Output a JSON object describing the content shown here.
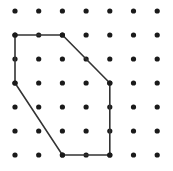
{
  "figure": {
    "background_color": "#ffffff",
    "width": 173,
    "height": 171
  },
  "grid": {
    "name": "geoboard-dot-grid",
    "columns": 7,
    "rows": 7,
    "origin_x": 15,
    "origin_y": 11,
    "spacing_x": 23.7,
    "spacing_y": 24.0,
    "dot_radius": 2.6,
    "dot_color": "#1a1a1a"
  },
  "shape": {
    "name": "hexagon",
    "type": "polygon",
    "stroke_color": "#333333",
    "stroke_width": 1.6,
    "fill": "none",
    "vertices_grid": [
      {
        "col": 0,
        "row": 1
      },
      {
        "col": 2,
        "row": 1
      },
      {
        "col": 4,
        "row": 3
      },
      {
        "col": 4,
        "row": 6
      },
      {
        "col": 2,
        "row": 6
      },
      {
        "col": 0,
        "row": 3
      }
    ]
  },
  "chart_data": {
    "type": "scatter",
    "xlabel": "",
    "ylabel": "",
    "xlim": [
      0,
      6
    ],
    "ylim": [
      0,
      6
    ],
    "grid": false,
    "legend": "none",
    "categories": [
      "0",
      "1",
      "2",
      "3",
      "4",
      "5",
      "6"
    ],
    "series": [
      {
        "name": "grid-dots",
        "x": [
          0,
          1,
          2,
          3,
          4,
          5,
          6,
          0,
          1,
          2,
          3,
          4,
          5,
          6,
          0,
          1,
          2,
          3,
          4,
          5,
          6,
          0,
          1,
          2,
          3,
          4,
          5,
          6,
          0,
          1,
          2,
          3,
          4,
          5,
          6,
          0,
          1,
          2,
          3,
          4,
          5,
          6,
          0,
          1,
          2,
          3,
          4,
          5,
          6
        ],
        "y": [
          0,
          0,
          0,
          0,
          0,
          0,
          0,
          1,
          1,
          1,
          1,
          1,
          1,
          1,
          2,
          2,
          2,
          2,
          2,
          2,
          2,
          3,
          3,
          3,
          3,
          3,
          3,
          3,
          4,
          4,
          4,
          4,
          4,
          4,
          4,
          5,
          5,
          5,
          5,
          5,
          5,
          5,
          6,
          6,
          6,
          6,
          6,
          6,
          6
        ]
      },
      {
        "name": "hexagon-outline",
        "x": [
          0,
          2,
          4,
          4,
          2,
          0,
          0
        ],
        "y": [
          1,
          1,
          3,
          6,
          6,
          3,
          1
        ]
      }
    ]
  }
}
